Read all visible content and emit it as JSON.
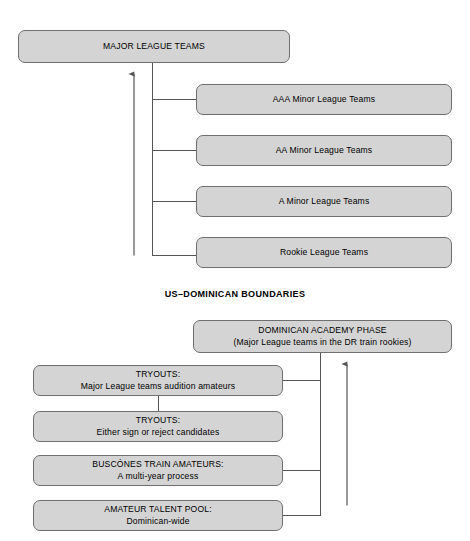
{
  "diagram": {
    "title_caption": "US–DOMINICAN BOUNDARIES",
    "top_section": {
      "root": {
        "label": "MAJOR LEAGUE TEAMS"
      },
      "levels": [
        {
          "label": "AAA Minor League Teams"
        },
        {
          "label": "AA Minor League Teams"
        },
        {
          "label": "A Minor League Teams"
        },
        {
          "label": "Rookie League Teams"
        }
      ]
    },
    "bottom_section": {
      "academy": {
        "line1": "DOMINICAN ACADEMY PHASE",
        "line2": "(Major League teams in the DR train rookies)"
      },
      "stages": [
        {
          "line1": "TRYOUTS:",
          "line2": "Major League teams audition amateurs"
        },
        {
          "line1": "TRYOUTS:",
          "line2": "Either sign or reject candidates"
        },
        {
          "line1": "BUSCÓNES TRAIN AMATEURS:",
          "line2": "A multi-year process"
        },
        {
          "line1": "AMATEUR TALENT POOL:",
          "line2": "Dominican-wide"
        }
      ]
    },
    "colors": {
      "node_fill": "#d4d4d4",
      "node_stroke": "#6f6f6f",
      "wire": "#555555",
      "background": "#ffffff",
      "text": "#000000"
    }
  }
}
